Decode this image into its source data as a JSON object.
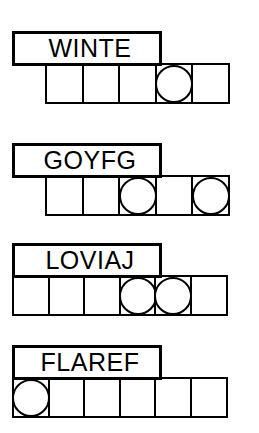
{
  "document": {
    "kind": "word-scramble-puzzle-worksheet",
    "background_color": "#ffffff",
    "ink_color": "#000000"
  },
  "puzzles": [
    {
      "id": "puzzle-1",
      "scrambled_word": "WINTE",
      "letter_count": 5,
      "answer_cells": 5,
      "circled_cells": [
        4
      ],
      "row_alignment": "indented"
    },
    {
      "id": "puzzle-2",
      "scrambled_word": "GOYFG",
      "letter_count": 5,
      "answer_cells": 5,
      "circled_cells": [
        3,
        5
      ],
      "row_alignment": "indented"
    },
    {
      "id": "puzzle-3",
      "scrambled_word": "LOVIAJ",
      "letter_count": 6,
      "answer_cells": 6,
      "circled_cells": [
        4,
        5
      ],
      "row_alignment": "flush"
    },
    {
      "id": "puzzle-4",
      "scrambled_word": "FLAREF",
      "letter_count": 6,
      "answer_cells": 6,
      "circled_cells": [
        1
      ],
      "row_alignment": "flush"
    }
  ]
}
